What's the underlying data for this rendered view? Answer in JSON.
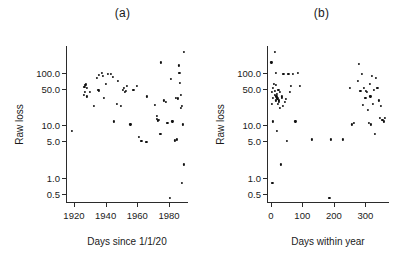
{
  "figure": {
    "background": "#ffffff",
    "point_color": "#111111",
    "axis_color": "#2b2b2b",
    "width": 402,
    "height": 265
  },
  "panels": [
    {
      "key": "a",
      "title": "(a)",
      "xlabel": "Days since 1/1/20",
      "ylabel": "Raw loss"
    },
    {
      "key": "b",
      "title": "(b)",
      "xlabel": "Days within year",
      "ylabel": "Raw loss"
    }
  ],
  "chart_data": [
    {
      "type": "scatter",
      "title": "(a)",
      "xlabel": "Days since 1/1/20",
      "ylabel": "Raw loss",
      "xticks": [
        1920,
        1940,
        1960,
        1980
      ],
      "xticklabels": [
        "1920",
        "1940",
        "1960",
        "1980"
      ],
      "yticks": [
        0.5,
        1.0,
        5.0,
        10.0,
        50.0,
        100.0
      ],
      "yticklabels": [
        "0.5",
        "1.0",
        "5.0",
        "10.0",
        "50.0",
        "100.0"
      ],
      "yscale": "log",
      "xlim": [
        1915,
        1992
      ],
      "ylim": [
        0.33,
        330
      ],
      "grid": false,
      "legend": "none",
      "x": [
        1918.8,
        1926.2,
        1926.6,
        1927.0,
        1927.2,
        1927.6,
        1928.0,
        1928.4,
        1930.0,
        1932.6,
        1934.4,
        1935.4,
        1935.8,
        1936.0,
        1937.8,
        1938.2,
        1939.0,
        1940.2,
        1941.6,
        1943.4,
        1944.6,
        1945.2,
        1947.0,
        1948.0,
        1949.6,
        1951.0,
        1951.6,
        1952.2,
        1953.0,
        1953.6,
        1955.6,
        1957.6,
        1959.8,
        1961.0,
        1962.6,
        1965.8,
        1966.2,
        1971.0,
        1972.2,
        1972.6,
        1973.0,
        1973.4,
        1974.6,
        1975.0,
        1976.6,
        1978.0,
        1979.0,
        1980.4,
        1981.0,
        1982.2,
        1983.6,
        1984.4,
        1985.0,
        1985.6,
        1986.2,
        1986.6,
        1987.0,
        1987.4,
        1987.6,
        1988.0,
        1988.4,
        1988.8,
        1989.2,
        1989.6
      ],
      "y": [
        8.0,
        38.0,
        55.0,
        44.0,
        60.0,
        62.0,
        36.0,
        52.0,
        44.0,
        24.0,
        80.0,
        48.0,
        46.0,
        94.0,
        100.0,
        88.0,
        34.0,
        62.0,
        95.0,
        98.0,
        84.0,
        12.0,
        26.0,
        72.0,
        24.0,
        48.0,
        52.0,
        44.0,
        46.0,
        58.0,
        10.5,
        48.0,
        58.0,
        6.0,
        5.0,
        4.8,
        36.0,
        25.0,
        15.0,
        13.5,
        12.5,
        13.0,
        7.0,
        160.0,
        30.0,
        28.0,
        11.0,
        0.42,
        78.0,
        12.0,
        5.2,
        34.0,
        5.4,
        33.0,
        140.0,
        100.0,
        66.0,
        38.0,
        22.0,
        24.0,
        0.8,
        10.5,
        1.8,
        250.0
      ]
    },
    {
      "type": "scatter",
      "title": "(b)",
      "xlabel": "Days within year",
      "ylabel": "Raw loss",
      "xticks": [
        0,
        100,
        200,
        300
      ],
      "xticklabels": [
        "0",
        "100",
        "200",
        "300"
      ],
      "yticks": [
        0.5,
        1.0,
        5.0,
        10.0,
        50.0,
        100.0
      ],
      "yticklabels": [
        "0.5",
        "1.0",
        "5.0",
        "10.0",
        "50.0",
        "100.0"
      ],
      "yscale": "log",
      "xlim": [
        -12,
        375
      ],
      "ylim": [
        0.33,
        330
      ],
      "grid": false,
      "legend": "none",
      "x": [
        2,
        3,
        4,
        5,
        6,
        7,
        8,
        10,
        12,
        13,
        14,
        15,
        16,
        17,
        18,
        19,
        20,
        21,
        22,
        24,
        25,
        26,
        28,
        30,
        32,
        34,
        36,
        38,
        40,
        44,
        48,
        52,
        56,
        60,
        64,
        70,
        78,
        86,
        92,
        130,
        186,
        190,
        228,
        252,
        258,
        264,
        276,
        280,
        284,
        288,
        292,
        296,
        300,
        302,
        306,
        308,
        312,
        314,
        316,
        318,
        320,
        324,
        326,
        330,
        334,
        338,
        342,
        346,
        350,
        354,
        358,
        362
      ],
      "y": [
        160.0,
        44.0,
        26.0,
        0.8,
        52.0,
        34.0,
        12.0,
        62.0,
        250.0,
        46.0,
        38.0,
        60.0,
        100.0,
        30.0,
        36.0,
        40.0,
        8.0,
        33.0,
        26.0,
        48.0,
        28.0,
        30.0,
        44.0,
        22.0,
        1.8,
        34.0,
        36.0,
        24.0,
        95.0,
        28.0,
        32.0,
        5.0,
        98.0,
        44.0,
        58.0,
        96.0,
        12.0,
        100.0,
        58.0,
        5.4,
        0.42,
        5.4,
        5.4,
        52.0,
        10.5,
        11.0,
        72.0,
        150.0,
        46.0,
        96.0,
        25.0,
        52.0,
        34.0,
        46.0,
        44.0,
        20.0,
        11.0,
        62.0,
        36.0,
        10.5,
        90.0,
        26.0,
        48.0,
        7.0,
        80.0,
        52.0,
        30.0,
        14.0,
        24.0,
        13.0,
        12.0,
        14.0
      ]
    }
  ]
}
